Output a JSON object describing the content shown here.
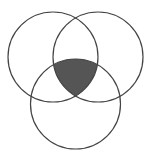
{
  "diagram": {
    "type": "venn-3",
    "background": "#ffffff",
    "stroke_color": "#444444",
    "shade_color": "#555555",
    "circles": [
      {
        "name": "left",
        "cx": 53,
        "cy": 57,
        "r": 45
      },
      {
        "name": "right",
        "cx": 98,
        "cy": 57,
        "r": 45
      },
      {
        "name": "bottom",
        "cx": 75.5,
        "cy": 104,
        "r": 45
      }
    ],
    "shaded_region": "intersection of all three circles"
  }
}
